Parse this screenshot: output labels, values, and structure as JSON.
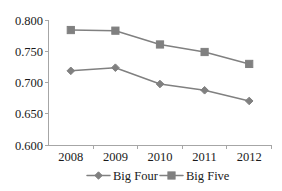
{
  "chart_data": {
    "type": "line",
    "title": "",
    "xlabel": "",
    "ylabel": "",
    "categories": [
      "2008",
      "2009",
      "2010",
      "2011",
      "2012"
    ],
    "series": [
      {
        "name": "Big Four",
        "marker": "diamond",
        "color": "#808080",
        "values": [
          0.719,
          0.724,
          0.698,
          0.688,
          0.671
        ]
      },
      {
        "name": "Big Five",
        "marker": "square",
        "color": "#808080",
        "values": [
          0.784,
          0.783,
          0.761,
          0.749,
          0.73
        ]
      }
    ],
    "ylim": [
      0.6,
      0.8
    ],
    "yticks": [
      "0.600",
      "0.650",
      "0.700",
      "0.750",
      "0.800"
    ],
    "ytick_values": [
      0.6,
      0.65,
      0.7,
      0.75,
      0.8
    ],
    "grid": false,
    "legend_position": "bottom"
  },
  "axis": {
    "y_labels": [
      "0.800",
      "0.750",
      "0.700",
      "0.650",
      "0.600"
    ],
    "x_labels": [
      "2008",
      "2009",
      "2010",
      "2011",
      "2012"
    ]
  },
  "legend": {
    "entries": [
      {
        "label": "Big Four",
        "marker": "diamond"
      },
      {
        "label": "Big Five",
        "marker": "square"
      }
    ]
  },
  "colors": {
    "line": "#808080",
    "marker_fill": "#808080",
    "axis": "#a6a6a6",
    "text": "#1a1a1a",
    "background": "#ffffff"
  }
}
